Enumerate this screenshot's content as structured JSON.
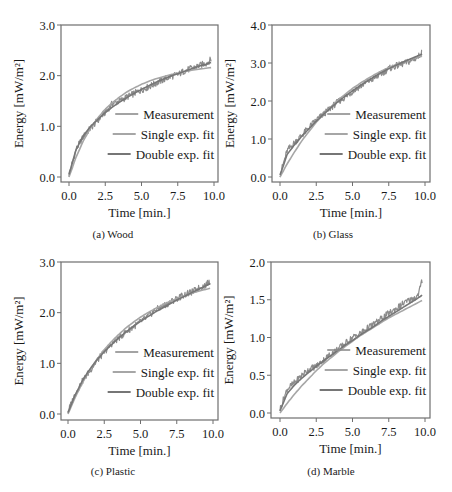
{
  "figure": {
    "legend": [
      "Measurement",
      "Single exp. fit",
      "Double exp. fit"
    ],
    "colors": {
      "measurement": "#8c8c8c",
      "single": "#a6a6a6",
      "double": "#767676",
      "axis": "#6e6e6e",
      "text": "#1a1a1a"
    },
    "xlabel": "Time [min.]",
    "ylabel": "Energy [mW/m²]"
  },
  "chart_data": [
    {
      "type": "line",
      "title": "(a) Wood",
      "xlabel": "Time [min.]",
      "ylabel": "Energy [mW/m²]",
      "xlim": [
        -0.5,
        10.3
      ],
      "ylim": [
        -0.1,
        3.0
      ],
      "xticks": [
        "0.0",
        "2.5",
        "5.0",
        "7.5",
        "10.0"
      ],
      "yticks": [
        "0.0",
        "1.0",
        "2.0",
        "3.0"
      ],
      "legend_position": "lower right",
      "grid": false,
      "x": [
        0,
        0.5,
        1,
        1.5,
        2,
        2.5,
        3,
        3.5,
        4,
        4.5,
        5,
        5.5,
        6,
        6.5,
        7,
        7.5,
        8,
        8.5,
        9,
        9.5,
        9.8
      ],
      "series": [
        {
          "name": "Measurement",
          "values": [
            0.05,
            0.55,
            0.8,
            0.97,
            1.12,
            1.28,
            1.45,
            1.5,
            1.58,
            1.65,
            1.72,
            1.78,
            1.85,
            1.92,
            1.98,
            2.02,
            2.1,
            2.15,
            2.2,
            2.25,
            2.32
          ]
        },
        {
          "name": "Single exp. fit",
          "values": [
            0.0,
            0.4,
            0.72,
            0.97,
            1.17,
            1.34,
            1.47,
            1.58,
            1.68,
            1.76,
            1.83,
            1.89,
            1.94,
            1.98,
            2.02,
            2.05,
            2.08,
            2.11,
            2.13,
            2.15,
            2.16
          ]
        },
        {
          "name": "Double exp. fit",
          "values": [
            0.05,
            0.55,
            0.82,
            1.0,
            1.14,
            1.27,
            1.38,
            1.48,
            1.57,
            1.65,
            1.73,
            1.8,
            1.87,
            1.93,
            1.99,
            2.04,
            2.09,
            2.14,
            2.19,
            2.23,
            2.26
          ]
        }
      ]
    },
    {
      "type": "line",
      "title": "(b) Glass",
      "xlabel": "Time [min.]",
      "ylabel": "Energy [mW/m²]",
      "xlim": [
        -0.5,
        10.3
      ],
      "ylim": [
        -0.1,
        4.0
      ],
      "xticks": [
        "0.0",
        "2.5",
        "5.0",
        "7.5",
        "10.0"
      ],
      "yticks": [
        "0.0",
        "1.0",
        "2.0",
        "3.0",
        "4.0"
      ],
      "legend_position": "lower right",
      "grid": false,
      "x": [
        0,
        0.5,
        1,
        1.5,
        2,
        2.5,
        3,
        3.5,
        4,
        4.5,
        5,
        5.5,
        6,
        6.5,
        7,
        7.5,
        8,
        8.5,
        9,
        9.5,
        9.8
      ],
      "series": [
        {
          "name": "Measurement",
          "values": [
            0.05,
            0.7,
            0.9,
            1.1,
            1.3,
            1.5,
            1.65,
            1.82,
            1.98,
            2.1,
            2.25,
            2.38,
            2.5,
            2.6,
            2.72,
            2.85,
            2.92,
            2.98,
            3.05,
            3.15,
            3.28
          ]
        },
        {
          "name": "Single exp. fit",
          "values": [
            0.0,
            0.35,
            0.66,
            0.95,
            1.2,
            1.44,
            1.65,
            1.84,
            2.02,
            2.18,
            2.33,
            2.46,
            2.58,
            2.69,
            2.79,
            2.88,
            2.96,
            3.03,
            3.1,
            3.16,
            3.19
          ]
        },
        {
          "name": "Double exp. fit",
          "values": [
            0.05,
            0.6,
            0.85,
            1.07,
            1.27,
            1.47,
            1.65,
            1.82,
            1.98,
            2.13,
            2.27,
            2.4,
            2.52,
            2.64,
            2.75,
            2.85,
            2.94,
            3.03,
            3.11,
            3.19,
            3.24
          ]
        }
      ]
    },
    {
      "type": "line",
      "title": "(c) Plastic",
      "xlabel": "Time [min.]",
      "ylabel": "Energy [mW/m²]",
      "xlim": [
        -0.5,
        10.3
      ],
      "ylim": [
        -0.1,
        3.0
      ],
      "xticks": [
        "0.0",
        "2.5",
        "5.0",
        "7.5",
        "10.0"
      ],
      "yticks": [
        "0.0",
        "1.0",
        "2.0",
        "3.0"
      ],
      "legend_position": "lower right",
      "grid": false,
      "x": [
        0,
        0.5,
        1,
        1.5,
        2,
        2.5,
        3,
        3.5,
        4,
        4.5,
        5,
        5.5,
        6,
        6.5,
        7,
        7.5,
        8,
        8.5,
        9,
        9.5,
        9.8
      ],
      "series": [
        {
          "name": "Measurement",
          "values": [
            0.05,
            0.4,
            0.65,
            0.85,
            1.05,
            1.22,
            1.38,
            1.5,
            1.62,
            1.72,
            1.82,
            1.92,
            2.05,
            2.12,
            2.2,
            2.28,
            2.35,
            2.4,
            2.48,
            2.55,
            2.62
          ]
        },
        {
          "name": "Single exp. fit",
          "values": [
            0.0,
            0.33,
            0.62,
            0.87,
            1.08,
            1.27,
            1.43,
            1.57,
            1.7,
            1.81,
            1.91,
            2.0,
            2.08,
            2.15,
            2.22,
            2.28,
            2.33,
            2.38,
            2.42,
            2.46,
            2.48
          ]
        },
        {
          "name": "Double exp. fit",
          "values": [
            0.03,
            0.38,
            0.66,
            0.88,
            1.07,
            1.23,
            1.37,
            1.5,
            1.62,
            1.73,
            1.83,
            1.92,
            2.01,
            2.09,
            2.17,
            2.25,
            2.32,
            2.39,
            2.46,
            2.53,
            2.57
          ]
        }
      ]
    },
    {
      "type": "line",
      "title": "(d) Marble",
      "xlabel": "Time [min.]",
      "ylabel": "Energy [mW/m²]",
      "xlim": [
        -0.5,
        10.3
      ],
      "ylim": [
        -0.05,
        2.0
      ],
      "xticks": [
        "0.0",
        "2.5",
        "5.0",
        "7.5",
        "10.0"
      ],
      "yticks": [
        "0.0",
        "0.5",
        "1.0",
        "1.5",
        "2.0"
      ],
      "legend_position": "lower right",
      "grid": false,
      "x": [
        0,
        0.5,
        1,
        1.5,
        2,
        2.5,
        3,
        3.5,
        4,
        4.5,
        5,
        5.5,
        6,
        6.5,
        7,
        7.5,
        8,
        8.5,
        9,
        9.5,
        9.8
      ],
      "series": [
        {
          "name": "Measurement",
          "values": [
            0.05,
            0.32,
            0.4,
            0.5,
            0.58,
            0.62,
            0.7,
            0.78,
            0.85,
            0.92,
            1.0,
            1.05,
            1.12,
            1.18,
            1.25,
            1.32,
            1.38,
            1.45,
            1.5,
            1.55,
            1.75
          ]
        },
        {
          "name": "Single exp. fit",
          "values": [
            0.0,
            0.13,
            0.25,
            0.36,
            0.46,
            0.56,
            0.65,
            0.73,
            0.81,
            0.88,
            0.95,
            1.02,
            1.08,
            1.14,
            1.2,
            1.26,
            1.31,
            1.36,
            1.41,
            1.46,
            1.49
          ]
        },
        {
          "name": "Double exp. fit",
          "values": [
            0.03,
            0.26,
            0.37,
            0.46,
            0.54,
            0.62,
            0.69,
            0.76,
            0.83,
            0.9,
            0.96,
            1.03,
            1.09,
            1.15,
            1.22,
            1.28,
            1.34,
            1.4,
            1.46,
            1.52,
            1.56
          ]
        }
      ]
    }
  ]
}
